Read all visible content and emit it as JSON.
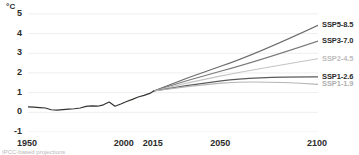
{
  "chart_data": {
    "type": "line",
    "title": "",
    "subtitle": "",
    "xlabel": "",
    "ylabel": "°C",
    "unit_label": "°C",
    "xlim": [
      1950,
      2100
    ],
    "ylim": [
      -1,
      5.4
    ],
    "grid": true,
    "grid_axis": "y",
    "legend_position": "right-inline",
    "x_ticks": [
      {
        "value": 1950,
        "label": "1950"
      },
      {
        "value": 2000,
        "label": "2000"
      },
      {
        "value": 2015,
        "label": "2015"
      },
      {
        "value": 2050,
        "label": "2050"
      },
      {
        "value": 2100,
        "label": "2100"
      }
    ],
    "y_ticks": [
      {
        "value": 5,
        "label": "5"
      },
      {
        "value": 4,
        "label": "4"
      },
      {
        "value": 3,
        "label": "3"
      },
      {
        "value": 2,
        "label": "2"
      },
      {
        "value": 1,
        "label": "1"
      },
      {
        "value": 0,
        "label": "0"
      },
      {
        "value": -1,
        "label": "-1"
      }
    ],
    "historical": {
      "name": "historical",
      "color": "#33322f",
      "x": [
        1950,
        1953,
        1956,
        1959,
        1962,
        1965,
        1968,
        1971,
        1974,
        1977,
        1980,
        1983,
        1986,
        1989,
        1992,
        1995,
        1998,
        2001,
        2004,
        2007,
        2010,
        2013,
        2015
      ],
      "values": [
        0.28,
        0.26,
        0.24,
        0.22,
        0.13,
        0.11,
        0.14,
        0.16,
        0.18,
        0.22,
        0.3,
        0.33,
        0.31,
        0.38,
        0.52,
        0.31,
        0.42,
        0.55,
        0.66,
        0.78,
        0.86,
        0.96,
        1.08
      ]
    },
    "series": [
      {
        "name": "SSP5-8.5",
        "label": "SSP5-8.5",
        "color": "#6b6b6b",
        "label_color": "#2b2b2b",
        "value_2015": 1.08,
        "value_2050": 2.35,
        "value_2100": 4.42,
        "mid_x": 2050
      },
      {
        "name": "SSP3-7.0",
        "label": "SSP3-7.0",
        "color": "#7a7a7a",
        "label_color": "#2b2b2b",
        "value_2015": 1.08,
        "value_2050": 2.1,
        "value_2100": 3.62,
        "mid_x": 2050
      },
      {
        "name": "SSP2-4.5",
        "label": "SSP2-4.5",
        "color": "#c4c4c4",
        "label_color": "#bdbdbd",
        "value_2015": 1.08,
        "value_2050": 1.85,
        "value_2100": 2.72,
        "mid_x": 2050
      },
      {
        "name": "SSP1-2.6",
        "label": "SSP1-2.6",
        "color": "#5a5a5a",
        "label_color": "#2b2b2b",
        "value_2015": 1.08,
        "value_2050": 1.6,
        "value_2100": 1.8,
        "mid_x": 2050
      },
      {
        "name": "SSP1-1.9",
        "label": "SSP1-1.9",
        "color": "#b5b5b5",
        "label_color": "#b0b0b0",
        "value_2015": 1.08,
        "value_2050": 1.48,
        "value_2100": 1.42,
        "mid_x": 2050
      }
    ],
    "footnote": "IPCC-based projections"
  }
}
